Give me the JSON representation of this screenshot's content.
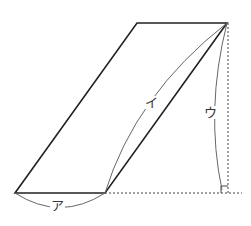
{
  "figure": {
    "shape": "parallelogram",
    "vertices": {
      "bottom_left": [
        15,
        193
      ],
      "bottom_right": [
        105,
        193
      ],
      "top_right": [
        227,
        23
      ],
      "top_left": [
        137,
        23
      ]
    },
    "labels": {
      "a": "ア",
      "i": "イ",
      "u": "ウ"
    },
    "colors": {
      "edge": "#222222",
      "arc": "#666666",
      "dotted": "#444444"
    }
  }
}
